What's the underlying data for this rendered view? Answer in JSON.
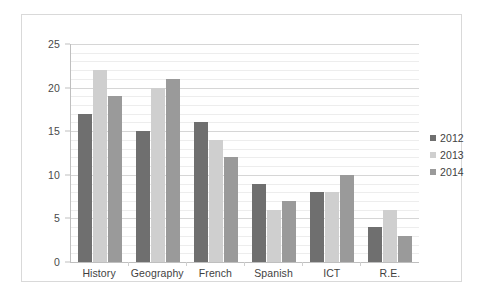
{
  "chart_data": {
    "type": "bar",
    "title": "",
    "subtitle": "",
    "xlabel": "",
    "ylabel": "",
    "categories": [
      "History",
      "Geography",
      "French",
      "Spanish",
      "ICT",
      "R.E."
    ],
    "series": [
      {
        "name": "2012",
        "color": "#6f6f6f",
        "values": [
          17,
          15,
          16,
          9,
          8,
          4
        ]
      },
      {
        "name": "2013",
        "color": "#cfcfcf",
        "values": [
          22,
          20,
          14,
          6,
          8,
          6
        ]
      },
      {
        "name": "2014",
        "color": "#9a9a9a",
        "values": [
          19,
          21,
          12,
          7,
          10,
          3
        ]
      }
    ],
    "ylim": [
      0,
      25
    ],
    "y_major_ticks": [
      0,
      5,
      10,
      15,
      20,
      25
    ],
    "y_minor_step": 1,
    "y_tick_labels": [
      "0",
      "5",
      "10",
      "15",
      "20",
      "25"
    ],
    "grid": true,
    "grid_axis": "y",
    "legend": {
      "position": "right",
      "entries": [
        "2012",
        "2013",
        "2014"
      ]
    }
  },
  "colors": {
    "series_2012": "#6f6f6f",
    "series_2013": "#cfcfcf",
    "series_2014": "#9a9a9a",
    "grid_minor": "#ededed",
    "grid_major": "#d6d6d6",
    "axis_line": "#bfbfbf",
    "frame_border": "#d9d9d9",
    "text": "#3f3f3f",
    "background": "#ffffff"
  }
}
